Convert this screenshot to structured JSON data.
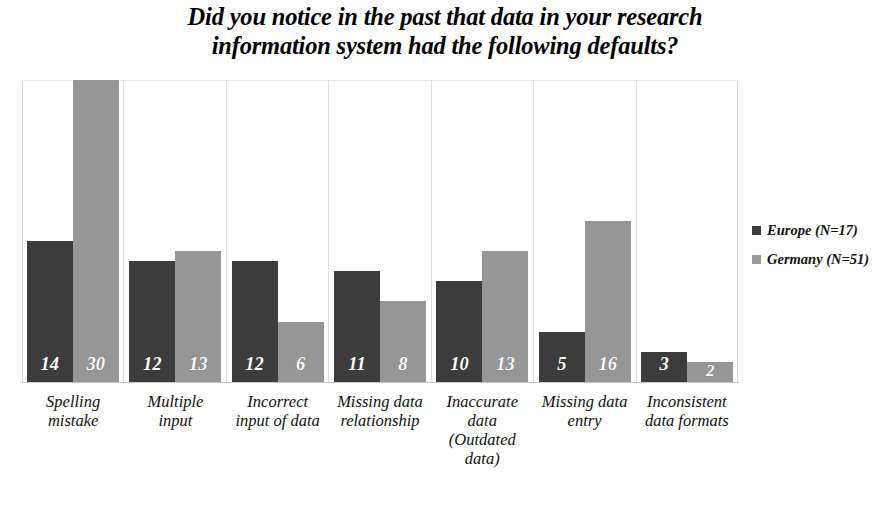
{
  "chart_data": {
    "type": "bar",
    "title": "Did you notice in the past that data in your research\ninformation system had the following defaults?",
    "xlabel": "",
    "ylabel": "",
    "ylim": [
      0,
      30
    ],
    "grid": false,
    "legend_position": "right",
    "value_labels": true,
    "categories": [
      "Spelling\nmistake",
      "Multiple\ninput",
      "Incorrect\ninput of data",
      "Missing data\nrelationship",
      "Inaccurate\ndata\n(Outdated\ndata)",
      "Missing data\nentry",
      "Inconsistent\ndata formats"
    ],
    "series": [
      {
        "name": "Europe (N=17)",
        "color": "#3c3c3c",
        "values": [
          14,
          12,
          12,
          11,
          10,
          5,
          3
        ]
      },
      {
        "name": "Germany (N=51)",
        "color": "#969696",
        "values": [
          30,
          13,
          6,
          8,
          13,
          16,
          2
        ]
      }
    ]
  },
  "legend": {
    "items": [
      {
        "label": "Europe (N=17)"
      },
      {
        "label": "Germany (N=51)"
      }
    ]
  }
}
